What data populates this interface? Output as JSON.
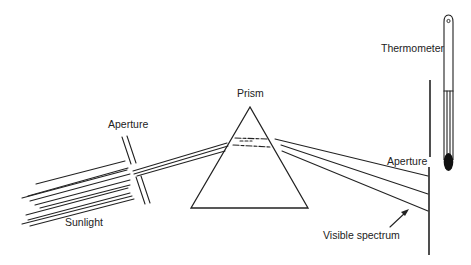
{
  "diagram": {
    "labels": {
      "sunlight": "Sunlight",
      "aperture_left": "Aperture",
      "prism": "Prism",
      "aperture_right": "Aperture",
      "thermometer": "Thermometer",
      "visible_spectrum": "Visible spectrum"
    },
    "colors": {
      "ink": "#222222",
      "background": "#ffffff"
    }
  }
}
